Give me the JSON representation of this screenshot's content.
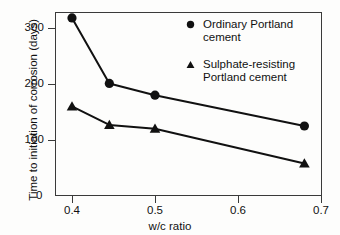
{
  "chart_data": {
    "type": "line",
    "title": "",
    "xlabel": "w/c ratio",
    "ylabel": "Time to initiation of corrosion (days)",
    "xlim": [
      0.37,
      0.7
    ],
    "ylim": [
      0,
      340
    ],
    "xticks": [
      0.4,
      0.5,
      0.6,
      0.7
    ],
    "xtick_labels": [
      "0.4",
      "0.5",
      "0.6",
      "0.7"
    ],
    "yticks": [
      0,
      100,
      200,
      300
    ],
    "ytick_labels": [
      "0",
      "100",
      "200",
      "300"
    ],
    "grid": false,
    "legend_position": "upper right",
    "series": [
      {
        "name": "Ordinary Portland cement",
        "marker": "circle",
        "x": [
          0.4,
          0.445,
          0.5,
          0.68
        ],
        "values": [
          318,
          201,
          180,
          125
        ]
      },
      {
        "name": "Sulphate-resisting Portland cement",
        "marker": "triangle",
        "x": [
          0.4,
          0.445,
          0.5,
          0.68
        ],
        "values": [
          160,
          127,
          120,
          58
        ]
      }
    ]
  },
  "axes": {
    "ylabel": "Time to initiation of corrosion (days)",
    "xlabel": "w/c ratio",
    "ytick_labels": [
      "300",
      "200",
      "100",
      "0"
    ],
    "xtick_labels": [
      "0.4",
      "0.5",
      "0.6",
      "0.7"
    ],
    "zero_label": "0"
  },
  "legend": {
    "items": [
      {
        "marker": "circle",
        "label": "Ordinary Portland\ncement"
      },
      {
        "marker": "triangle",
        "label": "Sulphate-resisting\nPortland cement"
      }
    ]
  },
  "colors": {
    "ink": "#111111",
    "axis": "#3a3a3a",
    "background": "#fdfdfc"
  }
}
